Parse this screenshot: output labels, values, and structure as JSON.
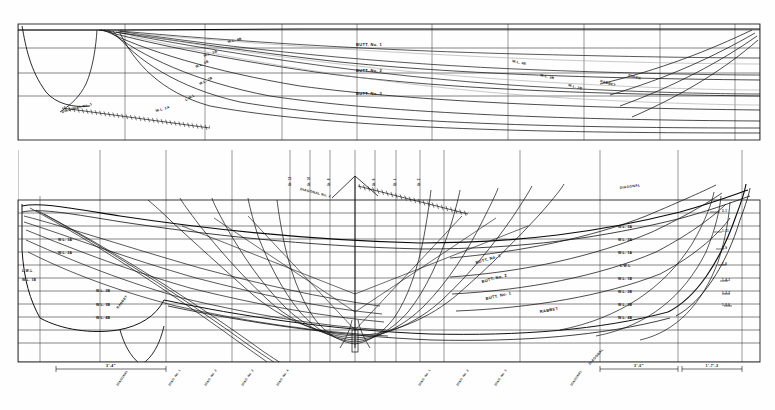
{
  "drawing": {
    "kind": "ship-lines-plan",
    "background": "#fefefe",
    "ink": "#101010",
    "grid_ink": "#2a2a2a",
    "faint_ink": "#8a8a8a",
    "width": 775,
    "height": 410
  },
  "upper_panel": {
    "name": "half-breadth-plan",
    "frame": {
      "x": 18,
      "y": 24,
      "w": 742,
      "h": 116
    },
    "buttock_labels": [
      {
        "text": "BUTT. No. 1",
        "x": 356,
        "y": 46
      },
      {
        "text": "BUTT. No. 2",
        "x": 356,
        "y": 72
      },
      {
        "text": "BUTT. No. 3",
        "x": 356,
        "y": 95
      }
    ],
    "waterline_labels": [
      {
        "text": "W.L. 4B",
        "x": 228,
        "y": 43,
        "rot": -14
      },
      {
        "text": "W.L. 3B",
        "x": 204,
        "y": 57,
        "rot": -20
      },
      {
        "text": "W.L. 2B",
        "x": 196,
        "y": 68,
        "rot": -24
      },
      {
        "text": "W.L. 1B",
        "x": 200,
        "y": 85,
        "rot": -27
      },
      {
        "text": "L.W.L",
        "x": 186,
        "y": 101,
        "rot": -30
      },
      {
        "text": "W.L. 1A",
        "x": 156,
        "y": 112,
        "rot": -16
      },
      {
        "text": "W.L. 4B",
        "x": 512,
        "y": 62,
        "rot": 13
      },
      {
        "text": "W.L. 3B",
        "x": 540,
        "y": 76,
        "rot": 14
      },
      {
        "text": "W.L. 2B",
        "x": 568,
        "y": 86,
        "rot": 15
      }
    ],
    "diagonal_labels": [
      {
        "text": "DIAGONAL No. 1",
        "x": 62,
        "y": 113,
        "rot": -15
      },
      {
        "text": "RABBET",
        "x": 600,
        "y": 82,
        "rot": 16
      },
      {
        "text": "SHEER",
        "x": 628,
        "y": 76,
        "rot": 17
      }
    ]
  },
  "lower_panel": {
    "name": "sheer-profile-and-body-plan",
    "frame": {
      "x": 18,
      "y": 200,
      "w": 742,
      "h": 162
    },
    "waterline_labels_right": [
      {
        "text": "W.L. 3A",
        "x": 618,
        "y": 228
      },
      {
        "text": "W.L. 2A",
        "x": 618,
        "y": 241
      },
      {
        "text": "W.L. 1A",
        "x": 618,
        "y": 254
      },
      {
        "text": "L.W.L",
        "x": 620,
        "y": 267
      },
      {
        "text": "W.L. 1B",
        "x": 618,
        "y": 280
      },
      {
        "text": "W.L. 2B",
        "x": 618,
        "y": 293
      },
      {
        "text": "W.L. 3B",
        "x": 618,
        "y": 306
      },
      {
        "text": "W.L. 4B",
        "x": 618,
        "y": 319
      }
    ],
    "waterline_labels_left": [
      {
        "text": "W.L. 3A",
        "x": 58,
        "y": 241
      },
      {
        "text": "W.L. 2A",
        "x": 58,
        "y": 254
      },
      {
        "text": "L.W.L",
        "x": 22,
        "y": 272
      },
      {
        "text": "W.L. 1B",
        "x": 22,
        "y": 281
      },
      {
        "text": "W.L. 2B",
        "x": 96,
        "y": 292
      },
      {
        "text": "W.L. 3B",
        "x": 96,
        "y": 306
      },
      {
        "text": "W.L. 4B",
        "x": 96,
        "y": 319
      }
    ],
    "buttock_labels": [
      {
        "text": "BUTT. No. 3",
        "x": 476,
        "y": 264,
        "rot": -16
      },
      {
        "text": "BUTT. No. 2",
        "x": 482,
        "y": 283,
        "rot": -15
      },
      {
        "text": "BUTT. No. 1",
        "x": 486,
        "y": 300,
        "rot": -13
      },
      {
        "text": "RABBET",
        "x": 540,
        "y": 313,
        "rot": -10
      }
    ],
    "profile_labels": [
      {
        "text": "DIAGONAL",
        "x": 620,
        "y": 189,
        "rot": -8
      },
      {
        "text": "DIAGONAL No. 2",
        "x": 300,
        "y": 190,
        "rot": 14
      },
      {
        "text": "RABBET",
        "x": 118,
        "y": 309,
        "rot": -52
      },
      {
        "text": "DIAGONAL",
        "x": 590,
        "y": 365,
        "rot": -48
      }
    ],
    "station_numbers_top": [
      {
        "text": "St. 12",
        "x": 291,
        "y": 186
      },
      {
        "text": "St. 10",
        "x": 310,
        "y": 186
      },
      {
        "text": "St. 8",
        "x": 330,
        "y": 186
      },
      {
        "text": "St. 6",
        "x": 375,
        "y": 186
      },
      {
        "text": "St. 4",
        "x": 396,
        "y": 186
      },
      {
        "text": "St. 2",
        "x": 420,
        "y": 186
      }
    ],
    "offsets_right": [
      {
        "text": "2-1",
        "x": 722,
        "y": 212
      },
      {
        "text": "1-11",
        "x": 722,
        "y": 232
      },
      {
        "text": "1-9",
        "x": 722,
        "y": 249
      },
      {
        "text": "1-6",
        "x": 722,
        "y": 265
      },
      {
        "text": "1-4-2",
        "x": 722,
        "y": 281
      },
      {
        "text": "1-2-2",
        "x": 722,
        "y": 294
      },
      {
        "text": "1-0-6",
        "x": 722,
        "y": 306
      }
    ],
    "dimensions": [
      {
        "text": "3'-4\"",
        "x": 78,
        "y": 366,
        "x1": 56,
        "x2": 166,
        "y_line": 369
      },
      {
        "text": "3'-0\"",
        "x": 628,
        "y": 366,
        "x1": 600,
        "x2": 678,
        "y_line": 369
      },
      {
        "text": "1'-7'-3",
        "x": 698,
        "y": 366,
        "x1": 682,
        "x2": 742,
        "y_line": 369
      }
    ],
    "bottom_diagonal_labels": [
      {
        "text": "DIAGONAL",
        "x": 118,
        "y": 386,
        "rot": -56
      },
      {
        "text": "DIAG. No. 1",
        "x": 170,
        "y": 386,
        "rot": -56
      },
      {
        "text": "DIAG. No. 2",
        "x": 206,
        "y": 386,
        "rot": -56
      },
      {
        "text": "DIAG. No. 3",
        "x": 243,
        "y": 386,
        "rot": -56
      },
      {
        "text": "DIAG. No. 4",
        "x": 278,
        "y": 386,
        "rot": -56
      },
      {
        "text": "DIAG. No. 1",
        "x": 420,
        "y": 386,
        "rot": -56
      },
      {
        "text": "DIAG. No. 2",
        "x": 458,
        "y": 386,
        "rot": -56
      },
      {
        "text": "DIAG. No. 3",
        "x": 496,
        "y": 386,
        "rot": -56
      },
      {
        "text": "DIAGONAL",
        "x": 572,
        "y": 386,
        "rot": -56
      }
    ]
  }
}
